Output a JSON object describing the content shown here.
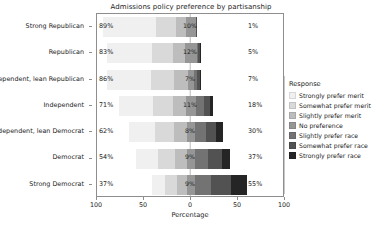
{
  "chart_data": {
    "type": "bar",
    "subtype": "diverging-stacked-likert",
    "title": "Admissions policy preference by partisanship",
    "xlabel": "Percentage",
    "ylabel": "",
    "xlim": [
      -100,
      100
    ],
    "xticks": [
      -100,
      -50,
      0,
      50,
      100
    ],
    "xticklabels": [
      "100",
      "50",
      "0",
      "50",
      "100"
    ],
    "grid": false,
    "legend_position": "right",
    "legend_title": "Response",
    "categories": [
      "Strong Republican",
      "Republican",
      "Independent, lean Republican",
      "Independent",
      "Independent, lean Democrat",
      "Democrat",
      "Strong Democrat"
    ],
    "series": [
      {
        "name": "Strongly prefer merit",
        "color": "#f0f0f0",
        "values": [
          57,
          48,
          47,
          36,
          28,
          23,
          14
        ]
      },
      {
        "name": "Somewhat prefer merit",
        "color": "#d9d9d9",
        "values": [
          21,
          22,
          24,
          21,
          20,
          18,
          13
        ]
      },
      {
        "name": "Slightly prefer merit",
        "color": "#bdbdbd",
        "values": [
          11,
          13,
          15,
          14,
          14,
          13,
          10
        ]
      },
      {
        "name": "No preference",
        "color": "#969696",
        "values": [
          10,
          12,
          7,
          11,
          8,
          9,
          9
        ]
      },
      {
        "name": "Slightly prefer race",
        "color": "#737373",
        "values": [
          0,
          2,
          3,
          8,
          12,
          14,
          17
        ]
      },
      {
        "name": "Somewhat prefer race",
        "color": "#525252",
        "values": [
          1,
          2,
          3,
          7,
          11,
          14,
          21
        ]
      },
      {
        "name": "Strongly prefer race",
        "color": "#252525",
        "values": [
          0,
          1,
          1,
          3,
          7,
          9,
          17
        ]
      }
    ],
    "left_labels": [
      "89%",
      "83%",
      "86%",
      "71%",
      "62%",
      "54%",
      "37%"
    ],
    "center_labels": [
      "10%",
      "12%",
      "7%",
      "11%",
      "8%",
      "9%",
      "9%"
    ],
    "right_labels": [
      "1%",
      "5%",
      "7%",
      "18%",
      "30%",
      "37%",
      "55%"
    ]
  },
  "legend": {
    "title": "Response",
    "items": [
      {
        "label": "Strongly prefer merit",
        "color": "#f0f0f0"
      },
      {
        "label": "Somewhat prefer merit",
        "color": "#d9d9d9"
      },
      {
        "label": "Slightly prefer merit",
        "color": "#bdbdbd"
      },
      {
        "label": "No preference",
        "color": "#969696"
      },
      {
        "label": "Slightly prefer race",
        "color": "#737373"
      },
      {
        "label": "Somewhat prefer race",
        "color": "#525252"
      },
      {
        "label": "Strongly prefer race",
        "color": "#252525"
      }
    ]
  }
}
